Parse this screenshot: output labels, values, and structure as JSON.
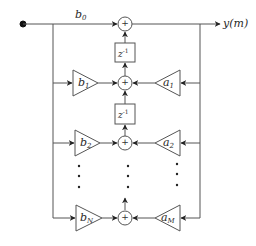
{
  "diagram": {
    "type": "IIR filter direct-form signal flow graph",
    "line_color": "#555555",
    "input_node": {
      "label": ""
    },
    "feedforward_top": {
      "coef": "b",
      "sub": "0"
    },
    "output": {
      "label": "y(m)"
    },
    "delays": [
      {
        "label": "z",
        "exp": "-1"
      },
      {
        "label": "z",
        "exp": "-1"
      }
    ],
    "adders": [
      {
        "symbol": "+"
      },
      {
        "symbol": "+"
      },
      {
        "symbol": "+"
      },
      {
        "symbol": "+"
      }
    ],
    "feedforward_gains": [
      {
        "coef": "b",
        "sub": "1"
      },
      {
        "coef": "b",
        "sub": "2"
      },
      {
        "coef": "b",
        "sub": "N"
      }
    ],
    "feedback_gains": [
      {
        "coef": "a",
        "sub": "1"
      },
      {
        "coef": "a",
        "sub": "2"
      },
      {
        "coef": "a",
        "sub": "M"
      }
    ],
    "ellipsis": "⋮"
  }
}
